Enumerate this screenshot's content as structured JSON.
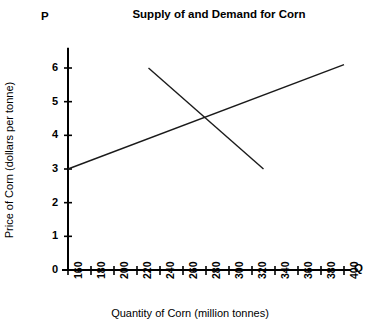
{
  "chart_data": {
    "type": "line",
    "title": "Supply of and Demand for Corn",
    "xlabel": "Quantity of Corn (million tonnes)",
    "ylabel": "Price of Corn (dollars per tonne)",
    "x_axis_letter": "Q",
    "y_axis_letter": "P",
    "xlim": [
      160,
      400
    ],
    "ylim": [
      0,
      6.6
    ],
    "xticks": [
      160,
      180,
      200,
      220,
      240,
      260,
      280,
      300,
      320,
      340,
      360,
      380,
      400
    ],
    "xtick_labels": [
      "160",
      "180",
      "200",
      "220",
      "240",
      "260",
      "280",
      "300",
      "320",
      "340",
      "360",
      "380",
      "400"
    ],
    "yticks": [
      0,
      1,
      2,
      3,
      4,
      5,
      6
    ],
    "ytick_labels": [
      "0",
      "1",
      "2",
      "3",
      "4",
      "5",
      "6"
    ],
    "grid": false,
    "legend": "none",
    "line_color": "#1a1a1a",
    "axis_color": "#000000",
    "series": [
      {
        "name": "Supply",
        "points": [
          [
            160,
            3.0
          ],
          [
            400,
            6.1
          ]
        ]
      },
      {
        "name": "Demand",
        "points": [
          [
            230,
            6.0
          ],
          [
            330,
            3.0
          ]
        ]
      }
    ],
    "equilibrium": {
      "quantity": 280,
      "price": 4.5
    }
  }
}
